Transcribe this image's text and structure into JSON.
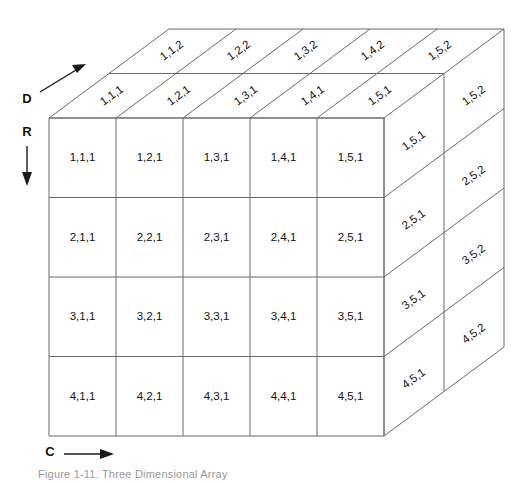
{
  "figure": {
    "caption": "Figure 1-11.  Three Dimensional Array",
    "axes": [
      {
        "id": "D",
        "label": "D",
        "direction": "diagonal-up-right",
        "meaning": "depth"
      },
      {
        "id": "R",
        "label": "R",
        "direction": "down",
        "meaning": "row"
      },
      {
        "id": "C",
        "label": "C",
        "direction": "right",
        "meaning": "column"
      }
    ],
    "dimensions": {
      "rows": 4,
      "columns": 5,
      "depth": 2
    },
    "front_face": {
      "name": "front-face-layer-1",
      "rows": [
        [
          "1,1,1",
          "1,2,1",
          "1,3,1",
          "1,4,1",
          "1,5,1"
        ],
        [
          "2,1,1",
          "2,2,1",
          "2,3,1",
          "2,4,1",
          "2,5,1"
        ],
        [
          "3,1,1",
          "3,2,1",
          "3,3,1",
          "3,4,1",
          "3,5,1"
        ],
        [
          "4,1,1",
          "4,2,1",
          "4,3,1",
          "4,4,1",
          "4,5,1"
        ]
      ]
    },
    "top_face": {
      "name": "top-face",
      "near_row": [
        "1,1,1",
        "1,2,1",
        "1,3,1",
        "1,4,1",
        "1,5,1"
      ],
      "far_row": [
        "1,1,2",
        "1,2,2",
        "1,3,2",
        "1,4,2",
        "1,5,2"
      ]
    },
    "right_face": {
      "name": "right-face",
      "near_column": [
        "1,5,1",
        "2,5,1",
        "3,5,1",
        "4,5,1"
      ],
      "far_column": [
        "1,5,2",
        "2,5,2",
        "3,5,2",
        "4,5,2"
      ]
    },
    "colors": {
      "line": "#6b6b6b",
      "axis": "#1a1a1a",
      "text": "#111111",
      "background": "#ffffff",
      "caption": "#9a9a9a"
    }
  }
}
